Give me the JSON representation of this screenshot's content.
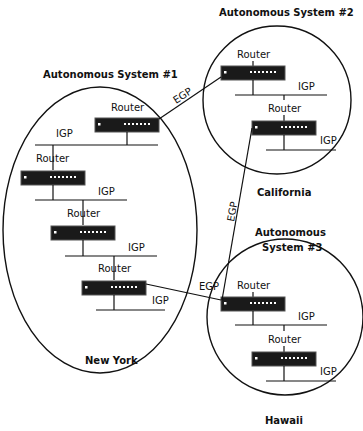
{
  "systems": [
    {
      "name": "Autonomous System #1",
      "location": "New York"
    },
    {
      "name": "Autonomous System #2",
      "location": "California"
    },
    {
      "name": "Autonomous",
      "name2": "System #3",
      "location": "Hawaii"
    }
  ],
  "labels": {
    "router": "Router",
    "igp": "IGP",
    "egp": "EGP"
  }
}
